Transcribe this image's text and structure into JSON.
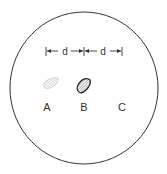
{
  "diagram": {
    "dimension_label_1": "d",
    "dimension_label_2": "d",
    "points": [
      {
        "label": "A",
        "style": "faint-hatched-blob"
      },
      {
        "label": "B",
        "style": "dark-outlined-hatched-blob"
      },
      {
        "label": "C",
        "style": "none"
      }
    ],
    "colors": {
      "line": "#333333",
      "faint": "#aaaaaa",
      "background": "#ffffff"
    }
  }
}
